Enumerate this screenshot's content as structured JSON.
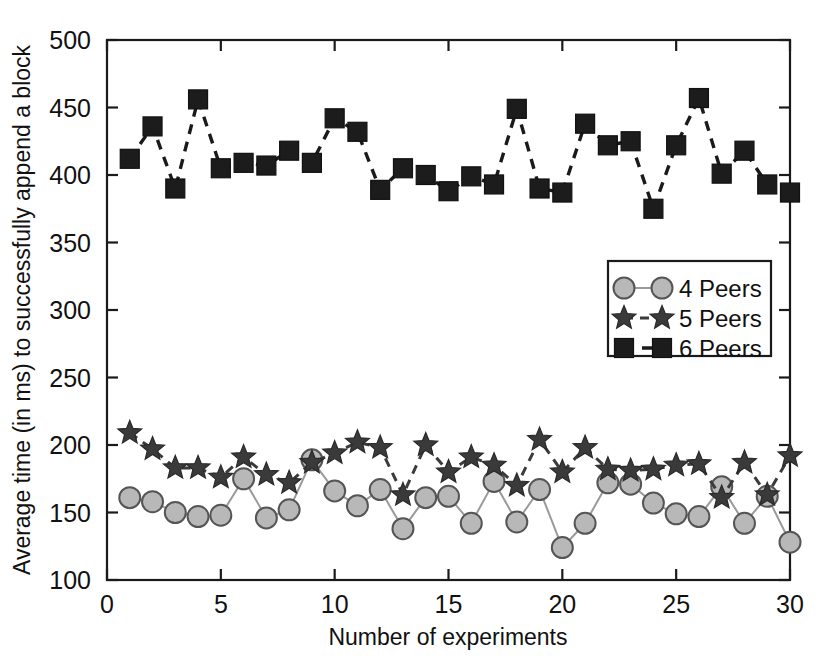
{
  "chart_data": {
    "type": "line",
    "title": "",
    "xlabel": "Number of experiments",
    "ylabel": "Average time (in ms) to successfully append a block",
    "xlim": [
      0,
      30
    ],
    "ylim": [
      100,
      500
    ],
    "xticks": [
      0,
      5,
      10,
      15,
      20,
      25,
      30
    ],
    "yticks": [
      100,
      150,
      200,
      250,
      300,
      350,
      400,
      450,
      500
    ],
    "grid": false,
    "legend_position": "center-right",
    "x": [
      1,
      2,
      3,
      4,
      5,
      6,
      7,
      8,
      9,
      10,
      11,
      12,
      13,
      14,
      15,
      16,
      17,
      18,
      19,
      20,
      21,
      22,
      23,
      24,
      25,
      26,
      27,
      28,
      29,
      30
    ],
    "series": [
      {
        "name": "4 Peers",
        "marker": "circle",
        "line_style": "solid",
        "color": "#b8b8b8",
        "values": [
          161,
          158,
          150,
          147,
          148,
          175,
          146,
          152,
          189,
          166,
          155,
          167,
          138,
          161,
          162,
          142,
          173,
          143,
          167,
          124,
          142,
          172,
          171,
          157,
          149,
          147,
          169,
          142,
          162,
          128
        ]
      },
      {
        "name": "5 Peers",
        "marker": "star",
        "line_style": "dashed",
        "color": "#3a3a3a",
        "values": [
          209,
          197,
          183,
          183,
          176,
          191,
          178,
          172,
          187,
          194,
          202,
          198,
          163,
          200,
          180,
          191,
          185,
          170,
          204,
          180,
          198,
          182,
          181,
          182,
          185,
          186,
          161,
          187,
          163,
          192
        ]
      },
      {
        "name": "6 Peers",
        "marker": "square",
        "line_style": "dashed",
        "color": "#1c1c1c",
        "values": [
          412,
          436,
          390,
          456,
          405,
          409,
          407,
          418,
          409,
          442,
          432,
          389,
          405,
          400,
          388,
          399,
          393,
          449,
          390,
          387,
          438,
          422,
          425,
          375,
          422,
          457,
          401,
          418,
          393,
          387
        ]
      }
    ],
    "legend_entries": [
      "4 Peers",
      "5 Peers",
      "6 Peers"
    ]
  },
  "axis": {
    "x_title": "Number of experiments",
    "y_title": "Average time (in ms) to successfully append a block",
    "xticks": [
      "0",
      "5",
      "10",
      "15",
      "20",
      "25",
      "30"
    ],
    "yticks": [
      "500",
      "450",
      "400",
      "350",
      "300",
      "250",
      "200",
      "150",
      "100"
    ]
  },
  "legend": {
    "items": [
      {
        "label": "4 Peers"
      },
      {
        "label": "5 Peers"
      },
      {
        "label": "6 Peers"
      }
    ]
  },
  "colors": {
    "circle_fill": "#b8b8b8",
    "circle_stroke": "#555555",
    "star_fill": "#3a3a3a",
    "square_fill": "#1c1c1c",
    "axis": "#1a1a1a",
    "background": "#ffffff"
  }
}
